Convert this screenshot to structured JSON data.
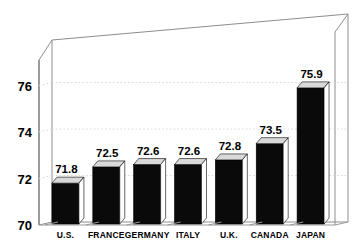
{
  "chart_data": {
    "type": "bar",
    "title": "",
    "subtitle": "",
    "xlabel": "",
    "ylabel": "",
    "categories": [
      "U.S.",
      "FRANCE",
      "GERMANY",
      "ITALY",
      "U.K.",
      "CANADA",
      "JAPAN"
    ],
    "values": [
      71.8,
      72.5,
      72.6,
      72.6,
      72.8,
      73.5,
      75.9
    ],
    "value_labels": [
      "71.8",
      "72.5",
      "72.6",
      "72.6",
      "72.8",
      "73.5",
      "75.9"
    ],
    "ylim": [
      70,
      77.1
    ],
    "yticks": [
      70,
      72,
      74,
      76
    ],
    "ytick_labels": [
      "70",
      "72",
      "74",
      "76"
    ],
    "grid": true,
    "gridlines_at": [
      72,
      74,
      76
    ],
    "legend": null,
    "legend_position": "none",
    "series": [
      {
        "name": "",
        "values": [
          71.8,
          72.5,
          72.6,
          72.6,
          72.8,
          73.5,
          75.9
        ]
      }
    ],
    "style": {
      "three_d": true,
      "bar_face_color": "#0a0a0a",
      "bar_top_color": "#d9d9d9",
      "bar_side_color": "#ffffff",
      "background_color": "#ffffff",
      "grid_color": "#d8d8d8",
      "frame_color": "#8d8d8d",
      "text_color": "#000000"
    }
  }
}
